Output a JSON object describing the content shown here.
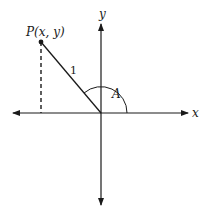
{
  "diagram": {
    "title": "",
    "axes": {
      "x_label": "x",
      "y_label": "y"
    },
    "point": {
      "label": "P(x, y)"
    },
    "segment": {
      "length_label": "1"
    },
    "angle": {
      "label": "A"
    },
    "colors": {
      "stroke": "#1a1a1a",
      "background": "#ffffff"
    }
  }
}
